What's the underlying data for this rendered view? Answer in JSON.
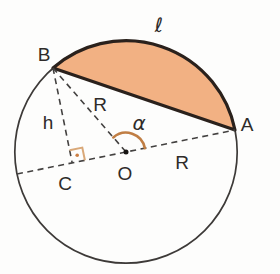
{
  "figure": {
    "labels": {
      "ell": "ℓ",
      "A": "A",
      "B": "B",
      "C": "C",
      "O": "O",
      "h": "h",
      "R_ob": "R",
      "R_oa": "R",
      "alpha": "α"
    },
    "colors": {
      "background": "#fdfdfc",
      "segment_fill": "#f2b183",
      "bold_stroke": "#2a211c",
      "thin_circle_stroke": "#3d3a38",
      "dashed_stroke": "#434140",
      "angle_arc": "#c07e44",
      "right_angle_marker": "#d9a878",
      "right_angle_dot": "#cc7f44",
      "label_color": "#2e2b29"
    },
    "geometry": {
      "circle": {
        "cx": 126,
        "cy": 152,
        "r": 111.2
      },
      "point_A": [
        235,
        130
      ],
      "point_B": [
        53,
        68
      ],
      "point_C": [
        72.2,
        162.9
      ],
      "point_O": [
        126,
        152
      ],
      "diameter_left_end": [
        17,
        174
      ],
      "central_angle_deg": 120
    }
  }
}
